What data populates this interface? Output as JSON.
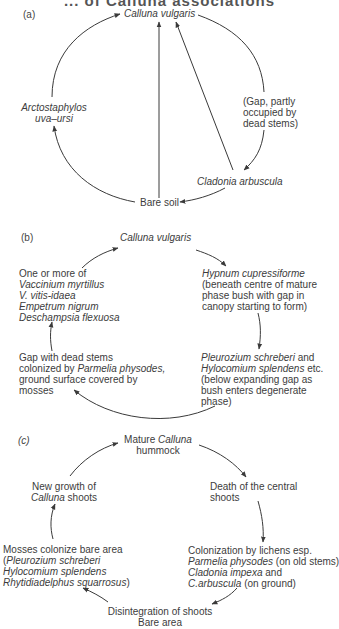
{
  "header": {
    "title_fragment": "... of Calluna associations"
  },
  "panels": {
    "a": {
      "label": "(a)",
      "nodes": {
        "top": "Calluna vulgaris",
        "left_1": "Arctostaphylos",
        "left_2": "uva–ursi",
        "right_1": "(Gap, partly",
        "right_2": "occupied by",
        "right_3": "dead stems)",
        "lower_right": "Cladonia arbuscula",
        "bottom": "Bare soil"
      }
    },
    "b": {
      "label": "(b)",
      "nodes": {
        "top": "Calluna vulgaris",
        "left_1": "One or more of",
        "left_2": "Vaccinium myrtillus",
        "left_3": "V. vitis-idaea",
        "left_4": "Empetrum nigrum",
        "left_5": "Deschampsia flexuosa",
        "right_1": "Hypnum cupressiforme",
        "right_2": "(beneath centre of mature",
        "right_3": "phase bush with gap in",
        "right_4": "canopy starting to form)",
        "lower_right_1a": "Pleurozium schreberi",
        "lower_right_1b": " and",
        "lower_right_2a": "Hylocomium splendens",
        "lower_right_2b": " etc.",
        "lower_right_3": "(below expanding gap as",
        "lower_right_4": "bush enters degenerate",
        "lower_right_5": "phase)",
        "lower_left_1": "Gap with dead stems",
        "lower_left_2a": "colonized by ",
        "lower_left_2b": "Parmelia physodes,",
        "lower_left_3": "ground surface covered by",
        "lower_left_4": "mosses"
      }
    },
    "c": {
      "label": "(c)",
      "nodes": {
        "top_1a": "Mature ",
        "top_1b": "Calluna",
        "top_2": "hummock",
        "right_1": "Death of the central",
        "right_2": "shoots",
        "lower_right_1": "Colonization by lichens esp.",
        "lower_right_2a": "Parmelia physodes",
        "lower_right_2b": " (on old stems)",
        "lower_right_3a": "Cladonia impexa",
        "lower_right_3b": " and",
        "lower_right_4a": "C.arbuscula",
        "lower_right_4b": " (on ground)",
        "bottom_1": "Disintegration of shoots",
        "bottom_2": "Bare area",
        "lower_left_1": "Mosses colonize bare area",
        "lower_left_2a": "(",
        "lower_left_2b": "Pleurozium schreberi",
        "lower_left_3": "Hylocomium splendens",
        "lower_left_4a": "Rhytidiadelphus squarrosus",
        "lower_left_4b": ")",
        "left_1": "New growth of",
        "left_2a": "Calluna",
        "left_2b": " shoots"
      }
    }
  },
  "colors": {
    "line": "#3a3a3a",
    "text": "#3c3c3c"
  }
}
